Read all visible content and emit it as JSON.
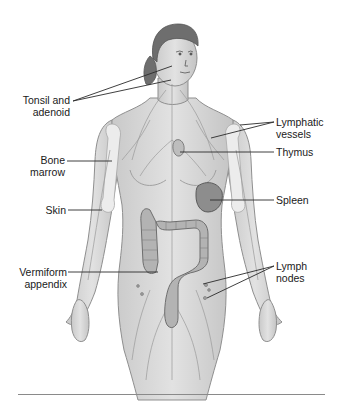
{
  "figure": {
    "colors": {
      "skin_fill": "#d9d9d9",
      "skin_stroke": "#8f8f8f",
      "hair": "#6e6e6e",
      "organ_fill": "#a9a9a9",
      "organ_stroke": "#6a6a6a",
      "vessel": "#9a9a9a",
      "leader_line": "#2a2a2a",
      "label_text": "#1a1a1a",
      "rule": "#8a8a8a"
    }
  },
  "labels": {
    "left": [
      {
        "id": "tonsil-adenoid",
        "line1": "Tonsil and",
        "line2": "adenoid"
      },
      {
        "id": "bone-marrow",
        "line1": "Bone",
        "line2": "marrow"
      },
      {
        "id": "skin",
        "line1": "Skin",
        "line2": ""
      },
      {
        "id": "vermiform-appendix",
        "line1": "Vermiform",
        "line2": "appendix"
      }
    ],
    "right": [
      {
        "id": "lymphatic-vessels",
        "line1": "Lymphatic",
        "line2": "vessels"
      },
      {
        "id": "thymus",
        "line1": "Thymus",
        "line2": ""
      },
      {
        "id": "spleen",
        "line1": "Spleen",
        "line2": ""
      },
      {
        "id": "lymph-nodes",
        "line1": "Lymph",
        "line2": "nodes"
      }
    ]
  }
}
